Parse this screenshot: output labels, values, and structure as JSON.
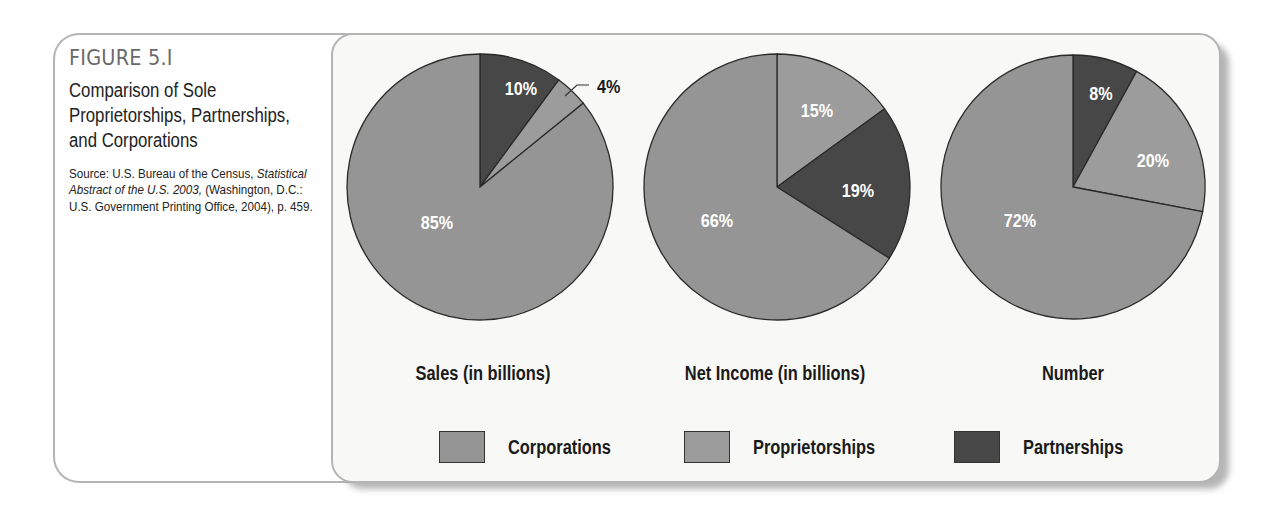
{
  "figure": {
    "number": "FIGURE 5.I",
    "title": "Comparison of Sole Proprietorships, Partnerships, and Corporations",
    "source_prefix": "Source: U.S. Bureau of the Census, ",
    "source_italic": "Statistical Abstract of the U.S. 2003,",
    "source_suffix": " (Washington, D.C.: U.S. Government Printing Office, 2004), p. 459."
  },
  "colors": {
    "corporations": "#959595",
    "proprietorships": "#9c9c9c",
    "partnerships": "#474747",
    "outline": "#2a2a2a",
    "label_on_slice": "#ffffff"
  },
  "legend": [
    {
      "key": "corporations",
      "label": "Corporations"
    },
    {
      "key": "proprietorships",
      "label": "Proprietorships"
    },
    {
      "key": "partnerships",
      "label": "Partnerships"
    }
  ],
  "chart_data": [
    {
      "type": "pie",
      "title": "Sales (in billions)",
      "categories": [
        "Partnerships",
        "Proprietorships",
        "Corporations"
      ],
      "values": [
        10,
        4,
        85
      ],
      "labels": [
        "10%",
        "4%",
        "85%"
      ],
      "start_angle": "12 o'clock, clockwise",
      "annotations": [
        {
          "text": "4%",
          "type": "callout-leader-line",
          "target": "Proprietorships"
        }
      ]
    },
    {
      "type": "pie",
      "title": "Net Income (in billions)",
      "categories": [
        "Proprietorships",
        "Partnerships",
        "Corporations"
      ],
      "values": [
        15,
        19,
        66
      ],
      "labels": [
        "15%",
        "19%",
        "66%"
      ],
      "start_angle": "12 o'clock, clockwise"
    },
    {
      "type": "pie",
      "title": "Number",
      "categories": [
        "Partnerships",
        "Proprietorships",
        "Corporations"
      ],
      "values": [
        8,
        20,
        72
      ],
      "labels": [
        "8%",
        "20%",
        "72%"
      ],
      "start_angle": "12 o'clock, clockwise"
    }
  ]
}
